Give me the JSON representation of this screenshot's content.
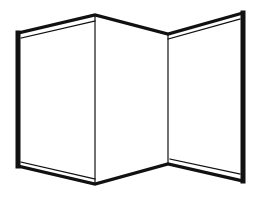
{
  "figure": {
    "subject": "three-panel folding screen line drawing",
    "stroke_color": "#111111",
    "background_color": "#ffffff",
    "panels": [
      {
        "name": "left-panel",
        "points": [
          [
            18,
            34
          ],
          [
            95,
            16
          ],
          [
            95,
            183
          ],
          [
            18,
            165
          ]
        ]
      },
      {
        "name": "middle-panel",
        "points": [
          [
            95,
            16
          ],
          [
            168,
            35
          ],
          [
            168,
            163
          ],
          [
            95,
            183
          ]
        ]
      },
      {
        "name": "right-panel",
        "points": [
          [
            168,
            35
          ],
          [
            243,
            14
          ],
          [
            243,
            180
          ],
          [
            168,
            163
          ]
        ]
      }
    ]
  }
}
